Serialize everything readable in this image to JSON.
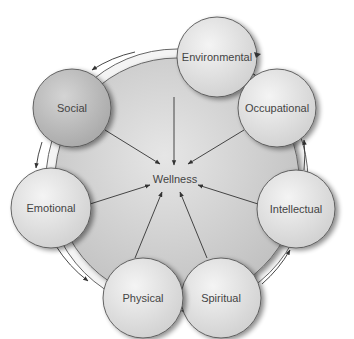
{
  "diagram": {
    "center_label": "Wellness",
    "nodes": [
      {
        "id": "environmental",
        "label": "Environmental",
        "cx": 217,
        "cy": 57,
        "r": 40,
        "fill": "#e2e2e2"
      },
      {
        "id": "occupational",
        "label": "Occupational",
        "cx": 277,
        "cy": 108,
        "r": 39,
        "fill": "#dcdcdc"
      },
      {
        "id": "intellectual",
        "label": "Intellectual",
        "cx": 296,
        "cy": 209,
        "r": 39,
        "fill": "#e4e4e4"
      },
      {
        "id": "spiritual",
        "label": "Spiritual",
        "cx": 221,
        "cy": 298,
        "r": 40,
        "fill": "#e6e6e6"
      },
      {
        "id": "physical",
        "label": "Physical",
        "cx": 143,
        "cy": 298,
        "r": 40,
        "fill": "#dedede"
      },
      {
        "id": "emotional",
        "label": "Emotional",
        "cx": 51,
        "cy": 208,
        "r": 40,
        "fill": "#e6e6e6"
      },
      {
        "id": "social",
        "label": "Social",
        "cx": 72,
        "cy": 108,
        "r": 39,
        "fill": "#bdbdbd"
      }
    ],
    "colors": {
      "disc": "#cfcfcf",
      "ring": "#f2f2f2",
      "stroke": "#555555",
      "text": "#444444"
    }
  }
}
